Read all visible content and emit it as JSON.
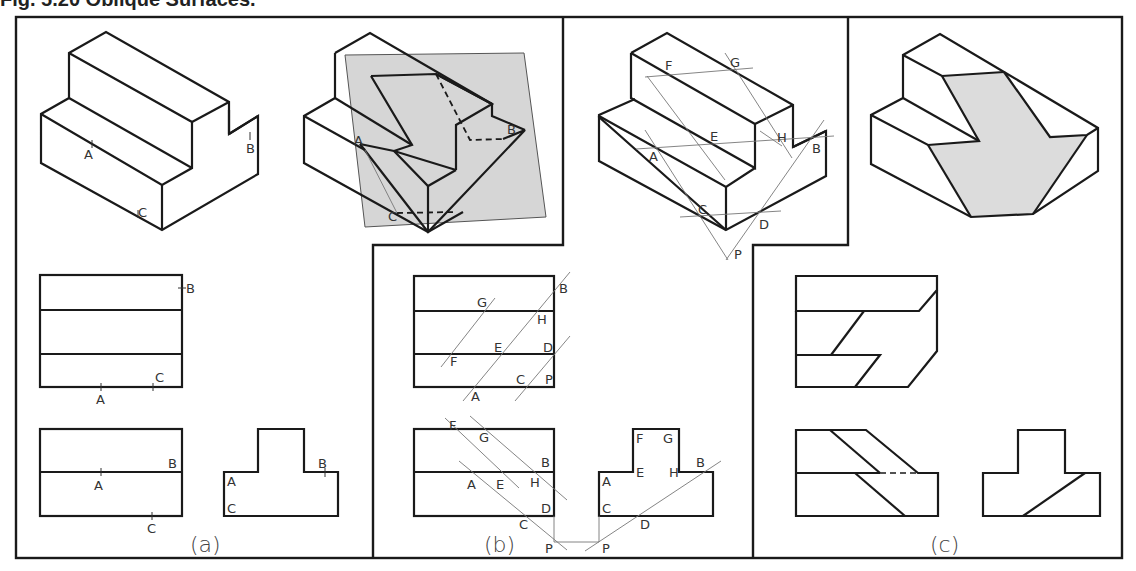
{
  "figure": {
    "title": "Fig. 5.20   Oblique Surfaces.",
    "panels": [
      {
        "id": "a",
        "caption": "(a)"
      },
      {
        "id": "b",
        "caption": "(b)"
      },
      {
        "id": "c",
        "caption": "(c)"
      }
    ]
  },
  "labels": {
    "a_iso": {
      "A": "A",
      "B": "B",
      "C": "C"
    },
    "a_top": {
      "A": "A",
      "B": "B",
      "C": "C"
    },
    "a_front": {
      "A": "A",
      "B": "B",
      "C": "C"
    },
    "a_side": {
      "A": "A",
      "B": "B",
      "C": "C"
    },
    "b_plane": {
      "A": "A",
      "B": "B",
      "C": "C"
    },
    "b_iso": {
      "A": "A",
      "B": "B",
      "C": "C",
      "D": "D",
      "E": "E",
      "F": "F",
      "G": "G",
      "H": "H",
      "P": "P"
    },
    "b_top": {
      "A": "A",
      "B": "B",
      "C": "C",
      "D": "D",
      "E": "E",
      "F": "F",
      "G": "G",
      "H": "H",
      "P": "P"
    },
    "b_front": {
      "A": "A",
      "B": "B",
      "C": "C",
      "D": "D",
      "E": "E",
      "F": "F",
      "G": "G",
      "H": "H",
      "P": "P"
    },
    "b_side": {
      "A": "A",
      "B": "B",
      "C": "C",
      "D": "D",
      "E": "E",
      "F": "F",
      "G": "G",
      "H": "H",
      "P": "P"
    }
  },
  "colors": {
    "line": "#1a1a1a",
    "construction": "#777777",
    "shading": "#d6d6d6",
    "background": "#ffffff"
  }
}
